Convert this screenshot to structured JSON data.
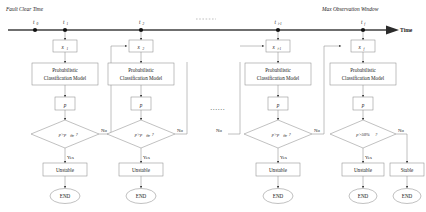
{
  "figure": {
    "type": "flowchart-timeline",
    "title_left": "Fault Clear Time",
    "title_right": "Max Observation Window",
    "axis_label": "Time",
    "ellipsis": "......"
  },
  "timeline": {
    "ticks": [
      {
        "id": "t0",
        "label": "t",
        "sub": "0",
        "x": 35
      },
      {
        "id": "t1",
        "label": "t",
        "sub": "1",
        "x": 65
      },
      {
        "id": "t2",
        "label": "t",
        "sub": "2",
        "x": 141
      },
      {
        "id": "ti1",
        "label": "t",
        "sub": "i-1",
        "x": 278
      },
      {
        "id": "tf",
        "label": "t",
        "sub": "f",
        "x": 363
      }
    ]
  },
  "columns": [
    {
      "id": "col-1",
      "input_var": "x",
      "input_sub": "1",
      "model_line1": "Probabilistic",
      "model_line2": "Classification Model",
      "prob_var": "p",
      "decision": "p>p",
      "decision_sub": "thr",
      "decision_tail": "?",
      "yes_label": "Yes",
      "no_label": "No",
      "result": "Unstable",
      "end": "END"
    },
    {
      "id": "col-2",
      "input_var": "x",
      "input_sub": "2",
      "model_line1": "Probabilistic",
      "model_line2": "Classification Model",
      "prob_var": "p",
      "decision": "p>p",
      "decision_sub": "thr",
      "decision_tail": "?",
      "yes_label": "Yes",
      "no_label": "No",
      "result": "Unstable",
      "end": "END"
    },
    {
      "id": "col-3",
      "input_var": "x",
      "input_sub": "i-1",
      "model_line1": "Probabilistic",
      "model_line2": "Classification Model",
      "prob_var": "p",
      "decision": "p>p",
      "decision_sub": "thr",
      "decision_tail": "?",
      "yes_label": "Yes",
      "no_label": "No",
      "no_label_in": "No",
      "result": "Unstable",
      "end": "END"
    },
    {
      "id": "col-4",
      "input_var": "x",
      "input_sub": "f",
      "model_line1": "Probabilistic",
      "model_line2": "Classification Model",
      "prob_var": "p",
      "decision": "p>50%",
      "decision_sub": "",
      "decision_tail": "?",
      "yes_label": "Yes",
      "no_label": "No",
      "result": "Unstable",
      "result_alt": "Stable",
      "end": "END",
      "end_alt": "END"
    }
  ],
  "mid_no_label": "No",
  "colors": {
    "axis": "#6f6f6f",
    "shape_stroke": "#8d8d8d",
    "text": "#1a1a1a",
    "background": "#ffffff"
  }
}
